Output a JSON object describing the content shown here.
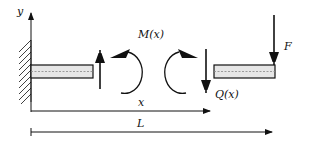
{
  "diagram": {
    "type": "cantilever-beam-free-body",
    "labels": {
      "y_axis": "y",
      "moment": "M(x)",
      "x_dim": "x",
      "shear": "Q(x)",
      "force": "F",
      "length": "L"
    },
    "colors": {
      "stroke": "#111111",
      "beam_fill": "#e6e6e6",
      "background": "#ffffff"
    }
  }
}
